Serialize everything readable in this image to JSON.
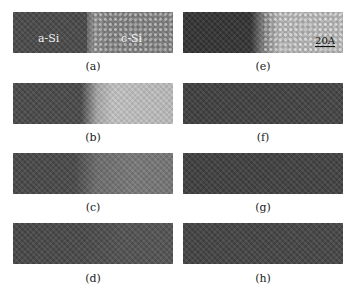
{
  "figure": {
    "panels": [
      {
        "id": "a",
        "label": "(a)",
        "left_label": "a-Si",
        "right_label": "c-Si",
        "left_color": "#4a4a4a",
        "right_color": "#8a8a8a",
        "interface_x": 74,
        "lattice": true
      },
      {
        "id": "b",
        "label": "(b)",
        "left_color": "#4a4a4a",
        "right_color": "#c4c4c4",
        "interface_x": 74,
        "lattice": false
      },
      {
        "id": "c",
        "label": "(c)",
        "left_color": "#484848",
        "right_color": "#7a7a7a",
        "interface_x": 72,
        "lattice": false
      },
      {
        "id": "d",
        "label": "(d)",
        "left_color": "#474747",
        "right_color": "#545454",
        "interface_x": 72,
        "lattice": false
      },
      {
        "id": "e",
        "label": "(e)",
        "left_color": "#333333",
        "right_color": "#c8c8c8",
        "interface_x": 75,
        "lattice": true,
        "scale_bar": "20A"
      },
      {
        "id": "f",
        "label": "(f)",
        "left_color": "#3f3f3f",
        "right_color": "#454545",
        "interface_x": 75,
        "lattice": false
      },
      {
        "id": "g",
        "label": "(g)",
        "left_color": "#3f3f3f",
        "right_color": "#434343",
        "interface_x": 75,
        "lattice": false
      },
      {
        "id": "h",
        "label": "(h)",
        "left_color": "#434343",
        "right_color": "#474747",
        "interface_x": 75,
        "lattice": false
      }
    ]
  }
}
